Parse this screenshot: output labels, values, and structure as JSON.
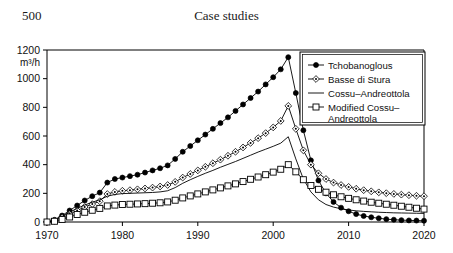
{
  "page": {
    "folio": "500",
    "running_head": "Case studies"
  },
  "chart_data": {
    "type": "line",
    "title": "",
    "xlabel": "",
    "ylabel": "m3/h",
    "ylabel_display": "m³/h",
    "xlim": [
      1970,
      2020
    ],
    "ylim": [
      0,
      1200
    ],
    "xticks": [
      1970,
      1980,
      1990,
      2000,
      2010,
      2020
    ],
    "yticks": [
      0,
      200,
      400,
      600,
      800,
      1000,
      1200
    ],
    "xtick_labels": [
      "1970",
      "1980",
      "1990",
      "2000",
      "2010",
      "2020"
    ],
    "ytick_labels": [
      "0",
      "200",
      "400",
      "600",
      "800",
      "1000",
      "1200"
    ],
    "grid": false,
    "legend_position": "upper-right",
    "series": [
      {
        "name": "Tchobanoglous",
        "marker": "filled-circle",
        "color": "#000000",
        "x": [
          1970,
          1971,
          1972,
          1973,
          1974,
          1975,
          1976,
          1977,
          1978,
          1979,
          1980,
          1981,
          1982,
          1983,
          1984,
          1985,
          1986,
          1987,
          1988,
          1989,
          1990,
          1991,
          1992,
          1993,
          1994,
          1995,
          1996,
          1997,
          1998,
          1999,
          2000,
          2001,
          2002,
          2003,
          2004,
          2005,
          2006,
          2007,
          2008,
          2009,
          2010,
          2011,
          2012,
          2013,
          2014,
          2015,
          2016,
          2017,
          2018,
          2019,
          2020
        ],
        "values": [
          0,
          15,
          45,
          80,
          115,
          150,
          180,
          205,
          275,
          300,
          310,
          320,
          330,
          345,
          360,
          375,
          395,
          440,
          490,
          530,
          570,
          610,
          650,
          690,
          730,
          775,
          820,
          865,
          910,
          960,
          1010,
          1065,
          1150,
          900,
          640,
          430,
          290,
          200,
          140,
          100,
          75,
          55,
          42,
          33,
          26,
          20,
          16,
          13,
          11,
          10,
          9
        ]
      },
      {
        "name": "Basse di Stura",
        "marker": "diamond-dot",
        "color": "#000000",
        "x": [
          1970,
          1971,
          1972,
          1973,
          1974,
          1975,
          1976,
          1977,
          1978,
          1979,
          1980,
          1981,
          1982,
          1983,
          1984,
          1985,
          1986,
          1987,
          1988,
          1989,
          1990,
          1991,
          1992,
          1993,
          1994,
          1995,
          1996,
          1997,
          1998,
          1999,
          2000,
          2001,
          2002,
          2003,
          2004,
          2005,
          2006,
          2007,
          2008,
          2009,
          2010,
          2011,
          2012,
          2013,
          2014,
          2015,
          2016,
          2017,
          2018,
          2019,
          2020
        ],
        "values": [
          0,
          10,
          30,
          55,
          80,
          105,
          125,
          145,
          195,
          210,
          218,
          222,
          228,
          234,
          240,
          248,
          258,
          280,
          310,
          335,
          360,
          385,
          410,
          435,
          462,
          490,
          520,
          552,
          585,
          620,
          660,
          705,
          810,
          650,
          500,
          400,
          340,
          300,
          275,
          258,
          245,
          232,
          222,
          214,
          207,
          201,
          196,
          191,
          187,
          183,
          180
        ]
      },
      {
        "name": "Cossu–Andreottola",
        "marker": "none",
        "color": "#000000",
        "x": [
          1970,
          1971,
          1972,
          1973,
          1974,
          1975,
          1976,
          1977,
          1978,
          1979,
          1980,
          1981,
          1982,
          1983,
          1984,
          1985,
          1986,
          1987,
          1988,
          1989,
          1990,
          1991,
          1992,
          1993,
          1994,
          1995,
          1996,
          1997,
          1998,
          1999,
          2000,
          2001,
          2002,
          2003,
          2004,
          2005,
          2006,
          2007,
          2008,
          2009,
          2010,
          2011,
          2012,
          2013,
          2014,
          2015,
          2016,
          2017,
          2018,
          2019,
          2020
        ],
        "values": [
          0,
          12,
          38,
          68,
          95,
          118,
          138,
          155,
          180,
          192,
          198,
          200,
          202,
          204,
          206,
          210,
          218,
          240,
          270,
          295,
          318,
          340,
          360,
          382,
          402,
          422,
          444,
          466,
          488,
          508,
          528,
          550,
          595,
          440,
          300,
          210,
          155,
          122,
          104,
          92,
          84,
          78,
          74,
          71,
          68,
          66,
          64,
          63,
          62,
          61,
          60
        ]
      },
      {
        "name": "Modified Cossu–Andreottola",
        "marker": "open-square",
        "color": "#000000",
        "x": [
          1970,
          1971,
          1972,
          1973,
          1974,
          1975,
          1976,
          1977,
          1978,
          1979,
          1980,
          1981,
          1982,
          1983,
          1984,
          1985,
          1986,
          1987,
          1988,
          1989,
          1990,
          1991,
          1992,
          1993,
          1994,
          1995,
          1996,
          1997,
          1998,
          1999,
          2000,
          2001,
          2002,
          2003,
          2004,
          2005,
          2006,
          2007,
          2008,
          2009,
          2010,
          2011,
          2012,
          2013,
          2014,
          2015,
          2016,
          2017,
          2018,
          2019,
          2020
        ],
        "values": [
          0,
          5,
          18,
          35,
          52,
          68,
          82,
          95,
          112,
          118,
          122,
          124,
          126,
          128,
          131,
          134,
          140,
          152,
          168,
          182,
          196,
          210,
          224,
          238,
          252,
          266,
          282,
          298,
          314,
          330,
          348,
          368,
          400,
          350,
          295,
          255,
          228,
          208,
          190,
          176,
          165,
          155,
          146,
          138,
          131,
          124,
          117,
          110,
          103,
          96,
          90
        ]
      }
    ]
  },
  "legend": {
    "entries": [
      {
        "label": "Tchobanoglous",
        "marker": "filled-circle"
      },
      {
        "label": "Basse di Stura",
        "marker": "diamond-dot"
      },
      {
        "label": "Cossu–Andreottola",
        "marker": "none"
      },
      {
        "label": "Modified Cossu–",
        "label2": "Andreottola",
        "marker": "open-square"
      }
    ]
  }
}
